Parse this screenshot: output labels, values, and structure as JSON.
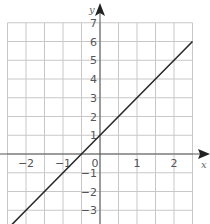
{
  "chart_data": {
    "type": "line",
    "title": "",
    "xlabel": "x",
    "ylabel": "y",
    "xlim": [
      -2.5,
      2.5
    ],
    "ylim": [
      -3.5,
      7
    ],
    "grid": true,
    "x_grid_step": 0.5,
    "y_grid_step": 1,
    "x_ticks": [
      -2,
      -1,
      0,
      1,
      2
    ],
    "x_tick_labels": [
      "−2",
      "−1",
      "0",
      "1",
      "2"
    ],
    "y_ticks": [
      7,
      6,
      5,
      4,
      3,
      2,
      1,
      -1,
      -2,
      -3
    ],
    "y_tick_labels": [
      "7",
      "6",
      "5",
      "4",
      "3",
      "2",
      "1",
      "−1",
      "−2",
      "−3"
    ],
    "series": [
      {
        "name": "y = 2x + 1",
        "equation": "y = 2x + 1",
        "x": [
          -2.5,
          -2,
          -1,
          -0.5,
          0,
          1,
          2,
          2.5
        ],
        "values": [
          -4,
          -3,
          -1,
          0,
          1,
          3,
          5,
          6
        ]
      }
    ]
  },
  "colors": {
    "grid": "#c8c8c8",
    "axis": "#555555",
    "line": "#2a2a2a",
    "background": "#ffffff"
  }
}
